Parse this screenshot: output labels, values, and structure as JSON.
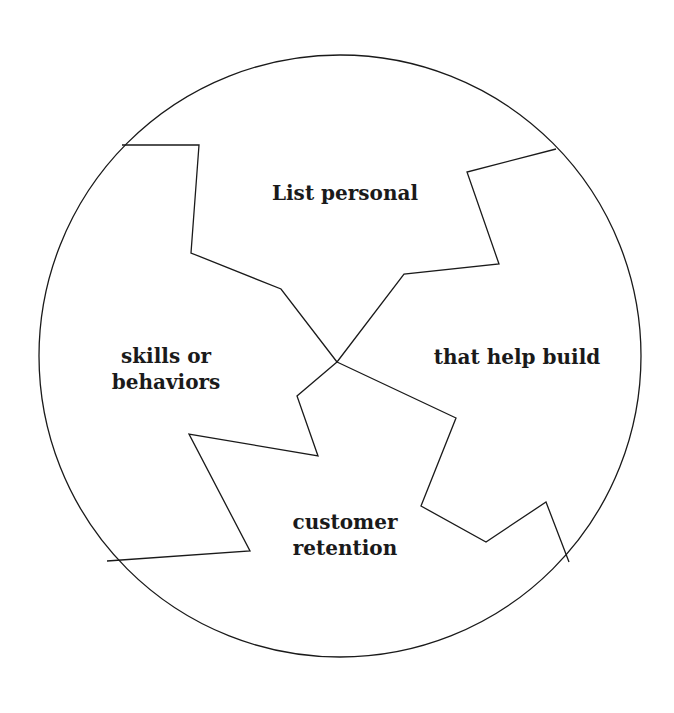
{
  "diagram": {
    "type": "puzzle-circle",
    "stroke_color": "#1a1a1a",
    "background": "#ffffff",
    "circle": {
      "cx": 340,
      "cy": 356,
      "r": 301
    },
    "center_point": [
      337,
      362
    ],
    "dividers": [
      {
        "name": "divider-top-left",
        "points": "337,362 281,289 191,253 199,145 122,145"
      },
      {
        "name": "divider-top-right",
        "points": "337,362 404,274 499,264 467,172 556,149"
      },
      {
        "name": "divider-bottom-left",
        "points": "337,362 297,396 318,456 189,434 250,551 107,561"
      },
      {
        "name": "divider-bottom-right",
        "points": "337,362 456,418 421,506 486,542 546,502 569,562"
      }
    ],
    "segments": [
      {
        "name": "segment-top",
        "lines": [
          "List personal"
        ],
        "x": 345,
        "y": 193
      },
      {
        "name": "segment-left",
        "lines": [
          "skills or",
          "behaviors"
        ],
        "x": 166,
        "y": 369
      },
      {
        "name": "segment-right",
        "lines": [
          "that help build"
        ],
        "x": 517,
        "y": 357
      },
      {
        "name": "segment-bottom",
        "lines": [
          "customer",
          "retention"
        ],
        "x": 345,
        "y": 535
      }
    ]
  }
}
